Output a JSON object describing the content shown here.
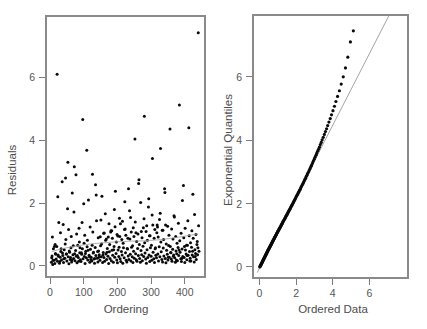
{
  "figure": {
    "width": 427,
    "height": 329,
    "background": "#ffffff",
    "point_color": "#0a0a0a",
    "axis_color": "#7d7d7d",
    "text_color": "#4d4d4d"
  },
  "chart_data": [
    {
      "type": "scatter",
      "panel": "left",
      "title": "",
      "xlabel": "Ordering",
      "ylabel": "Residuals",
      "xlim": [
        -12,
        460
      ],
      "ylim": [
        -0.35,
        7.95
      ],
      "xticks": [
        0,
        100,
        200,
        300,
        400
      ],
      "xticklabels": [
        "0",
        "100",
        "200",
        "300",
        "400"
      ],
      "yticks": [
        0,
        2,
        4,
        6
      ],
      "yticklabels": [
        "0",
        "2",
        "4",
        "6"
      ],
      "grid": false,
      "legend": null,
      "overlay": {
        "type": "lowess",
        "color": "#9a9a9a",
        "x": [
          5,
          40,
          80,
          120,
          160,
          200,
          240,
          280,
          320,
          360,
          400,
          440
        ],
        "y": [
          0.46,
          0.56,
          0.64,
          0.7,
          0.74,
          0.77,
          0.79,
          0.8,
          0.83,
          0.88,
          0.95,
          1.02
        ]
      },
      "x": [
        4,
        6,
        8,
        10,
        12,
        14,
        16,
        18,
        20,
        22,
        24,
        26,
        28,
        30,
        32,
        34,
        36,
        38,
        40,
        42,
        44,
        46,
        48,
        50,
        52,
        54,
        56,
        58,
        60,
        62,
        64,
        66,
        68,
        70,
        72,
        74,
        76,
        78,
        80,
        82,
        84,
        86,
        88,
        90,
        92,
        94,
        96,
        98,
        100,
        102,
        104,
        106,
        108,
        110,
        112,
        114,
        116,
        118,
        120,
        122,
        124,
        126,
        128,
        130,
        132,
        134,
        136,
        138,
        140,
        142,
        144,
        146,
        148,
        150,
        152,
        154,
        156,
        158,
        160,
        162,
        164,
        166,
        168,
        170,
        172,
        174,
        176,
        178,
        180,
        182,
        184,
        186,
        188,
        190,
        192,
        194,
        196,
        198,
        200,
        202,
        204,
        206,
        208,
        210,
        212,
        214,
        216,
        218,
        220,
        222,
        224,
        226,
        228,
        230,
        232,
        234,
        236,
        238,
        240,
        242,
        244,
        246,
        248,
        250,
        252,
        254,
        256,
        258,
        260,
        262,
        264,
        266,
        268,
        270,
        272,
        274,
        276,
        278,
        280,
        282,
        284,
        286,
        288,
        290,
        292,
        294,
        296,
        298,
        300,
        302,
        304,
        306,
        308,
        310,
        312,
        314,
        316,
        318,
        320,
        322,
        324,
        326,
        328,
        330,
        332,
        334,
        336,
        338,
        340,
        342,
        344,
        346,
        348,
        350,
        352,
        354,
        356,
        358,
        360,
        362,
        364,
        366,
        368,
        370,
        372,
        374,
        376,
        378,
        380,
        382,
        384,
        386,
        388,
        390,
        392,
        394,
        396,
        398,
        400,
        402,
        404,
        406,
        408,
        410,
        412,
        414,
        416,
        418,
        420,
        422,
        424,
        426,
        428,
        430,
        432,
        434,
        436,
        438,
        440,
        442,
        5,
        9,
        13,
        17,
        21,
        25,
        29,
        33,
        37,
        41,
        45,
        49,
        53,
        57,
        61,
        65,
        69,
        73,
        77,
        81,
        85,
        89,
        93,
        97,
        101,
        105,
        109,
        113,
        117,
        121,
        125,
        129,
        133,
        137,
        141,
        145,
        149,
        153,
        157,
        161,
        165,
        169,
        173,
        177,
        181,
        185,
        189,
        193,
        197,
        201,
        205,
        209,
        213,
        217,
        221,
        225,
        229,
        233,
        237,
        241,
        245,
        249,
        253,
        257,
        261,
        265,
        269,
        273,
        277,
        281,
        285,
        289,
        293,
        297,
        301,
        305,
        309,
        313,
        317,
        321,
        325,
        329,
        333,
        337,
        341,
        345,
        349,
        353,
        357,
        361,
        365,
        369,
        373,
        377,
        381,
        385,
        389,
        393,
        397,
        401,
        405,
        409,
        413,
        417,
        421,
        425,
        429,
        433,
        437,
        441,
        7,
        15,
        23,
        31,
        39,
        47,
        55,
        63,
        71,
        79,
        87,
        95,
        103,
        111,
        119,
        127,
        135,
        143,
        151,
        159,
        167,
        175,
        183,
        191,
        199,
        207,
        215,
        223,
        231,
        239,
        247,
        255,
        263,
        271,
        279,
        287,
        295,
        303,
        311,
        319,
        327,
        335,
        343,
        351,
        359,
        367,
        375,
        383,
        391,
        399,
        407,
        415,
        423,
        431,
        439
      ],
      "y": [
        0.12,
        0.32,
        0.05,
        0.55,
        0.18,
        0.08,
        0.4,
        0.22,
        0.62,
        0.15,
        0.35,
        1.38,
        0.09,
        0.28,
        0.46,
        0.19,
        2.68,
        0.33,
        0.11,
        0.52,
        0.25,
        2.8,
        0.38,
        0.16,
        1.82,
        0.29,
        0.07,
        0.44,
        0.21,
        0.58,
        0.13,
        2.32,
        0.36,
        0.24,
        3.16,
        0.17,
        0.49,
        0.31,
        0.1,
        0.66,
        0.27,
        1.2,
        0.42,
        0.2,
        0.14,
        0.37,
        0.55,
        0.23,
        1.98,
        0.3,
        0.08,
        0.47,
        0.26,
        0.61,
        0.19,
        2.1,
        0.34,
        0.12,
        0.53,
        0.28,
        0.16,
        2.92,
        0.41,
        0.22,
        0.09,
        0.59,
        0.33,
        1.44,
        0.25,
        0.13,
        0.48,
        0.36,
        0.18,
        0.64,
        0.29,
        2.22,
        0.11,
        0.43,
        0.27,
        0.15,
        1.66,
        0.38,
        0.21,
        0.56,
        0.31,
        0.08,
        0.45,
        0.24,
        1.08,
        0.17,
        0.5,
        0.34,
        0.12,
        0.62,
        0.28,
        2.38,
        0.4,
        0.19,
        0.1,
        0.51,
        0.3,
        1.52,
        0.23,
        0.14,
        0.46,
        0.35,
        0.09,
        0.58,
        0.26,
        2.04,
        0.42,
        0.18,
        0.13,
        0.54,
        0.32,
        0.21,
        1.76,
        0.37,
        0.16,
        0.6,
        0.29,
        0.11,
        0.47,
        0.25,
        4.04,
        0.39,
        0.2,
        0.15,
        0.56,
        0.33,
        2.74,
        0.24,
        0.12,
        0.49,
        0.36,
        0.17,
        0.63,
        0.3,
        4.76,
        0.41,
        0.22,
        0.09,
        0.52,
        0.27,
        1.88,
        0.35,
        0.14,
        0.58,
        0.31,
        0.18,
        3.42,
        0.44,
        0.23,
        0.11,
        0.55,
        0.34,
        0.26,
        1.3,
        0.38,
        0.16,
        0.61,
        0.29,
        3.74,
        0.45,
        0.21,
        0.13,
        0.57,
        0.32,
        2.46,
        0.24,
        0.1,
        0.5,
        0.37,
        0.19,
        0.65,
        0.28,
        4.36,
        0.43,
        0.22,
        0.15,
        0.53,
        0.31,
        1.6,
        0.26,
        0.12,
        0.48,
        0.39,
        0.17,
        0.59,
        0.33,
        5.12,
        0.44,
        0.23,
        0.14,
        0.54,
        0.3,
        2.56,
        0.27,
        0.11,
        0.51,
        0.38,
        0.2,
        0.66,
        0.34,
        4.4,
        0.46,
        0.25,
        0.16,
        0.6,
        0.35,
        2.28,
        0.29,
        0.13,
        0.52,
        0.4,
        0.21,
        0.68,
        0.36,
        7.42,
        0.47,
        0.26,
        0.18,
        0.62,
        0.37,
        6.1,
        0.31,
        0.14,
        0.55,
        0.41,
        0.23,
        0.7,
        0.38,
        3.3,
        0.48,
        0.27,
        0.19,
        0.64,
        0.39,
        2.9,
        0.33,
        0.15,
        0.58,
        0.42,
        4.66,
        0.72,
        0.4,
        3.68,
        0.5,
        0.29,
        0.21,
        0.66,
        0.44,
        0.24,
        2.26,
        0.46,
        0.28,
        0.93,
        0.7,
        0.35,
        1.05,
        0.82,
        0.44,
        0.92,
        0.68,
        1.12,
        0.88,
        0.52,
        1.25,
        0.76,
        0.95,
        0.6,
        1.34,
        0.84,
        0.72,
        1.16,
        0.98,
        0.56,
        2.46,
        0.86,
        1.08,
        0.64,
        0.94,
        1.4,
        0.78,
        1.02,
        0.68,
        2.02,
        0.9,
        1.22,
        0.74,
        1.1,
        0.82,
        2.14,
        0.96,
        0.66,
        1.3,
        0.88,
        0.58,
        1.06,
        0.92,
        1.48,
        0.76,
        1.14,
        0.84,
        2.34,
        0.7,
        1.26,
        0.98,
        0.62,
        1.18,
        0.86,
        1.56,
        0.94,
        0.72,
        1.36,
        0.8,
        1.04,
        2.08,
        0.9,
        1.2,
        0.66,
        1.44,
        0.96,
        0.74,
        1.12,
        0.88,
        1.64,
        1.0,
        0.78,
        1.28,
        0.92,
        0.68,
        2.2,
        1.06,
        1.32,
        0.84,
        1.16,
        0.94,
        1.72,
        1.02,
        0.76,
        1.38,
        0.98,
        0.82,
        1.24,
        1.08,
        2.58,
        0.9,
        1.46,
        1.04,
        0.86,
        1.34,
        1.12,
        1.8,
        1.0,
        0.94,
        1.42,
        1.18,
        0.88,
        1.54,
        1.22,
        1.06,
        2.62,
        1.1,
        1.5,
        1.28,
        0.96,
        1.62,
        1.16,
        1.24,
        1.68,
        1.14,
        1.3,
        0.28,
        0.42,
        0.35,
        0.19,
        0.51,
        0.24,
        0.62,
        0.33,
        0.16,
        0.47,
        0.3,
        0.58,
        0.22,
        0.44,
        0.36,
        0.14,
        0.53,
        0.27,
        0.65,
        0.38,
        0.2,
        0.49,
        0.31,
        0.17,
        0.56,
        0.4,
        0.25,
        0.61,
        0.34,
        0.13,
        0.45,
        0.29,
        0.52,
        0.23,
        0.67,
        0.37,
        0.18,
        0.48,
        0.32,
        0.57,
        0.26,
        0.43,
        0.39,
        0.15,
        0.63,
        0.28,
        0.54,
        0.35,
        0.21,
        0.59,
        0.41,
        0.24,
        0.66,
        0.46,
        0.3,
        0.38
      ]
    },
    {
      "type": "scatter",
      "panel": "right",
      "title": "",
      "xlabel": "Ordered Data",
      "ylabel": "Exponential Quantiles",
      "xlim": [
        -0.35,
        8.1
      ],
      "ylim": [
        -0.35,
        7.95
      ],
      "xticks": [
        0,
        2,
        4,
        6
      ],
      "xticklabels": [
        "0",
        "2",
        "4",
        "6"
      ],
      "yticks": [
        0,
        2,
        4,
        6
      ],
      "yticklabels": [
        "0",
        "2",
        "4",
        "6"
      ],
      "grid": false,
      "legend": null,
      "overlay": {
        "type": "reference-line",
        "color": "#8c8c8c",
        "x": [
          -0.12,
          7.05
        ],
        "y": [
          -0.18,
          7.92
        ]
      },
      "x": [
        0.02,
        0.04,
        0.05,
        0.07,
        0.08,
        0.09,
        0.11,
        0.12,
        0.13,
        0.15,
        0.16,
        0.17,
        0.18,
        0.2,
        0.21,
        0.22,
        0.23,
        0.25,
        0.26,
        0.27,
        0.28,
        0.3,
        0.31,
        0.32,
        0.34,
        0.35,
        0.36,
        0.38,
        0.39,
        0.4,
        0.42,
        0.43,
        0.45,
        0.46,
        0.47,
        0.49,
        0.5,
        0.52,
        0.53,
        0.55,
        0.56,
        0.58,
        0.59,
        0.61,
        0.62,
        0.64,
        0.65,
        0.67,
        0.68,
        0.7,
        0.72,
        0.73,
        0.75,
        0.76,
        0.78,
        0.8,
        0.81,
        0.83,
        0.85,
        0.86,
        0.88,
        0.9,
        0.92,
        0.93,
        0.95,
        0.97,
        0.99,
        1.01,
        1.02,
        1.04,
        1.06,
        1.08,
        1.1,
        1.12,
        1.14,
        1.16,
        1.18,
        1.2,
        1.22,
        1.24,
        1.26,
        1.28,
        1.3,
        1.32,
        1.34,
        1.37,
        1.39,
        1.41,
        1.43,
        1.45,
        1.48,
        1.5,
        1.52,
        1.55,
        1.57,
        1.59,
        1.62,
        1.64,
        1.67,
        1.69,
        1.72,
        1.74,
        1.77,
        1.79,
        1.82,
        1.85,
        1.87,
        1.9,
        1.93,
        1.95,
        1.98,
        2.01,
        2.04,
        2.07,
        2.1,
        2.13,
        2.16,
        2.19,
        2.22,
        2.25,
        2.28,
        2.31,
        2.35,
        2.38,
        2.41,
        2.45,
        2.48,
        2.52,
        2.55,
        2.59,
        2.62,
        2.66,
        2.7,
        2.74,
        2.78,
        2.82,
        2.86,
        2.9,
        2.94,
        2.99,
        3.03,
        3.08,
        3.12,
        3.17,
        3.22,
        3.27,
        3.32,
        3.37,
        3.42,
        3.48,
        3.54,
        3.6,
        3.66,
        3.72,
        3.79,
        3.86,
        3.93,
        4.01,
        4.09,
        4.17,
        4.26,
        4.36,
        4.46,
        4.57,
        4.69,
        4.82,
        4.96,
        5.12,
        5.3,
        5.51,
        5.76,
        6.08,
        6.52,
        7.42
      ],
      "y": [
        0.0,
        0.02,
        0.04,
        0.05,
        0.07,
        0.08,
        0.1,
        0.11,
        0.13,
        0.14,
        0.16,
        0.17,
        0.19,
        0.2,
        0.22,
        0.23,
        0.25,
        0.26,
        0.28,
        0.29,
        0.31,
        0.32,
        0.34,
        0.35,
        0.37,
        0.38,
        0.4,
        0.42,
        0.43,
        0.45,
        0.46,
        0.48,
        0.5,
        0.51,
        0.53,
        0.54,
        0.56,
        0.58,
        0.59,
        0.61,
        0.63,
        0.64,
        0.66,
        0.68,
        0.69,
        0.71,
        0.73,
        0.75,
        0.76,
        0.78,
        0.8,
        0.82,
        0.83,
        0.85,
        0.87,
        0.89,
        0.91,
        0.93,
        0.94,
        0.96,
        0.98,
        1.0,
        1.02,
        1.04,
        1.06,
        1.08,
        1.1,
        1.12,
        1.14,
        1.16,
        1.18,
        1.2,
        1.22,
        1.24,
        1.26,
        1.28,
        1.31,
        1.33,
        1.35,
        1.37,
        1.39,
        1.42,
        1.44,
        1.46,
        1.48,
        1.51,
        1.53,
        1.55,
        1.58,
        1.6,
        1.63,
        1.65,
        1.68,
        1.7,
        1.73,
        1.75,
        1.78,
        1.81,
        1.83,
        1.86,
        1.89,
        1.92,
        1.94,
        1.97,
        2.0,
        2.03,
        2.06,
        2.09,
        2.12,
        2.15,
        2.18,
        2.22,
        2.25,
        2.28,
        2.31,
        2.35,
        2.38,
        2.42,
        2.45,
        2.49,
        2.53,
        2.56,
        2.6,
        2.64,
        2.68,
        2.72,
        2.76,
        2.8,
        2.85,
        2.89,
        2.94,
        2.98,
        3.03,
        3.08,
        3.13,
        3.18,
        3.23,
        3.29,
        3.34,
        3.4,
        3.46,
        3.52,
        3.58,
        3.65,
        3.71,
        3.78,
        3.86,
        3.93,
        4.01,
        4.09,
        4.18,
        4.27,
        4.36,
        4.46,
        4.57,
        4.68,
        4.8,
        4.93,
        5.07,
        5.22,
        5.38,
        5.56,
        5.77,
        6.0,
        6.28,
        6.62,
        7.1,
        7.45
      ]
    }
  ]
}
